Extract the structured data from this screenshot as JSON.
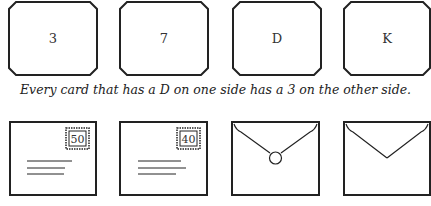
{
  "puzzle": {
    "cards": [
      {
        "face": "3"
      },
      {
        "face": "7"
      },
      {
        "face": "D"
      },
      {
        "face": "K"
      }
    ],
    "rule": "Every card that has a D on one side has a 3 on the other side.",
    "envelopes": [
      {
        "side": "front",
        "stamp": "50"
      },
      {
        "side": "front",
        "stamp": "40"
      },
      {
        "side": "back",
        "sealed": true
      },
      {
        "side": "back",
        "sealed": false
      }
    ]
  },
  "colors": {
    "stroke": "#222222",
    "background": "#ffffff"
  }
}
